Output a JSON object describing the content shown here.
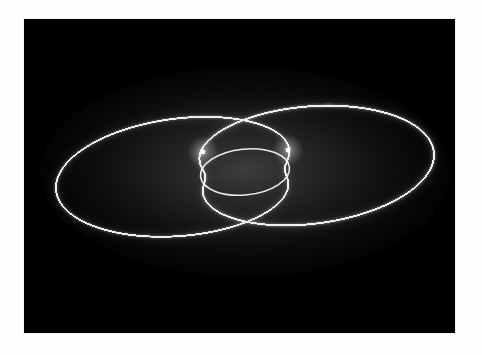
{
  "page": {
    "background_color": "#fefefe",
    "width": 482,
    "height": 355,
    "alt_text": "Long-exposure light painting of a spirograph pattern"
  },
  "photo": {
    "frame": {
      "x": 24,
      "y": 19,
      "width": 431,
      "height": 314,
      "background_color": "#000000",
      "border_color": "#f2f2f2"
    },
    "subject_name": "spirograph-light-painting",
    "description": "Luminous white spirograph disc photographed in long exposure against a black background",
    "line_color": "#f0f0f0",
    "glow_color": "#9aa0a8",
    "hot_node_color": "#ffffff"
  },
  "chart_data": {
    "type": "line",
    "xlabel": "",
    "ylabel": "",
    "grid": false,
    "legend": "none",
    "annotations": [
      "central dark elliptical hole",
      "left bright convergence node",
      "right bright convergence node",
      "outer scalloped petal rim"
    ],
    "projection": {
      "type": "oblique-tilt",
      "center_x": 245,
      "center_y": 172,
      "radius_x": 190,
      "radius_y": 84,
      "tilt_deg": -6
    },
    "curve": {
      "family": "hypotrochoid",
      "petals": 52,
      "R": 1.0,
      "r": 0.0192,
      "d": 0.62,
      "inner_hole_ratio": 0.21,
      "samples": 4200,
      "turns": 52
    },
    "nodes": [
      {
        "name": "left-node",
        "x": 203,
        "y": 152
      },
      {
        "name": "right-node",
        "x": 288,
        "y": 150
      }
    ],
    "extents": {
      "left_x": 50,
      "right_x": 432,
      "top_y": 88,
      "bottom_y": 258
    },
    "ylim": [
      88,
      258
    ],
    "xlim": [
      50,
      432
    ]
  }
}
